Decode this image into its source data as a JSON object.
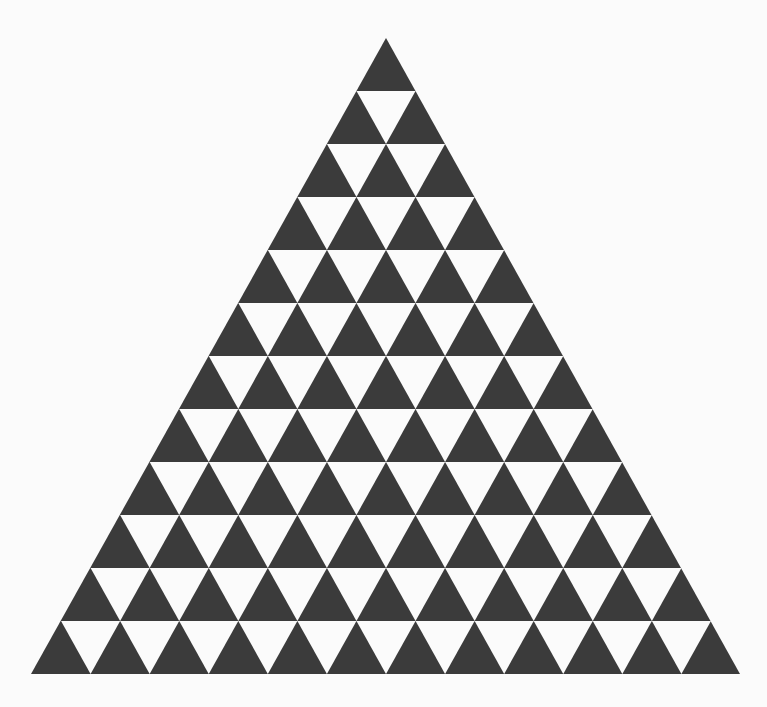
{
  "diagram": {
    "type": "triangular-tessellation",
    "rows": 12,
    "up_triangles_per_row": [
      1,
      2,
      3,
      4,
      5,
      6,
      7,
      8,
      9,
      10,
      11,
      12
    ],
    "down_triangles_per_row": [
      0,
      1,
      2,
      3,
      4,
      5,
      6,
      7,
      8,
      9,
      10,
      11
    ],
    "total_dark_triangles": 78,
    "total_white_triangles": 66,
    "geometry": {
      "apex": [
        386,
        38
      ],
      "base_left": [
        31,
        674
      ],
      "base_right": [
        740,
        674
      ]
    },
    "colors": {
      "background": "#fbfbfb",
      "dark_fill": "#3b3b3b",
      "light_fill": "#fbfbfb"
    }
  }
}
